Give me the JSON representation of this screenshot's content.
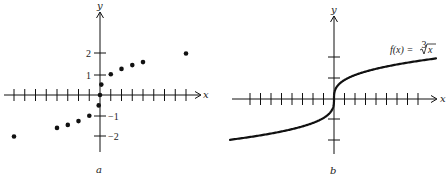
{
  "chart_data": [
    {
      "panel": "a",
      "type": "scatter",
      "title": "",
      "caption": "a",
      "xlabel": "x",
      "ylabel": "y",
      "x_ticks_count": {
        "negative": 8,
        "positive": 8
      },
      "y_tick_labels": [
        "2",
        "1",
        "−1",
        "−2"
      ],
      "y_ticks": [
        2,
        1,
        -1,
        -2
      ],
      "xlim": [
        -8.5,
        9.5
      ],
      "ylim": [
        -2.6,
        3.0
      ],
      "grid": false,
      "points": [
        {
          "x": -8,
          "y": -2
        },
        {
          "x": -4,
          "y": -1.587
        },
        {
          "x": -3,
          "y": -1.442
        },
        {
          "x": -2,
          "y": -1.26
        },
        {
          "x": -1,
          "y": -1
        },
        {
          "x": -0.125,
          "y": -0.5
        },
        {
          "x": 0,
          "y": 0
        },
        {
          "x": 0.125,
          "y": 0.5
        },
        {
          "x": 1,
          "y": 1
        },
        {
          "x": 2,
          "y": 1.26
        },
        {
          "x": 3,
          "y": 1.442
        },
        {
          "x": 4,
          "y": 1.587
        },
        {
          "x": 8,
          "y": 2
        }
      ]
    },
    {
      "panel": "b",
      "type": "line",
      "title": "",
      "caption": "b",
      "xlabel": "x",
      "ylabel": "y",
      "annotation": "f(x) = ∛x",
      "function": "cube_root",
      "x_ticks_count": {
        "negative": 8,
        "positive": 8
      },
      "y_ticks": [
        2,
        1,
        -1,
        -2
      ],
      "xlim": [
        -10,
        10
      ],
      "ylim": [
        -2.5,
        3.5
      ],
      "grid": false,
      "series": [
        {
          "name": "f(x) = ∛x",
          "x": [
            -10,
            -8,
            -6,
            -4,
            -2,
            -1,
            -0.5,
            -0.125,
            0,
            0.125,
            0.5,
            1,
            2,
            4,
            6,
            8,
            10
          ],
          "values": [
            -2.154,
            -2,
            -1.817,
            -1.587,
            -1.26,
            -1,
            -0.794,
            -0.5,
            0,
            0.5,
            0.794,
            1,
            1.26,
            1.587,
            1.817,
            2,
            2.154
          ]
        }
      ]
    }
  ],
  "labels": {
    "a": {
      "x_axis": "x",
      "y_axis": "y",
      "y2": "2",
      "y1": "1",
      "ym1": "−1",
      "ym2": "−2",
      "caption": "a"
    },
    "b": {
      "x_axis": "x",
      "y_axis": "y",
      "fn_prefix": "f(x) = ",
      "fn_index": "3",
      "fn_radicand": "x",
      "caption": "b"
    }
  },
  "colors": {
    "ink": "#111111",
    "background": "#ffffff"
  }
}
